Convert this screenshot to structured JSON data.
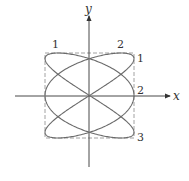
{
  "figure": {
    "type": "lissajous",
    "equations": {
      "x": "sin(3t)",
      "y": "sin(2t)"
    },
    "axes": {
      "x_label": "x",
      "y_label": "y"
    },
    "top_tangent_labels": [
      "1",
      "2"
    ],
    "right_tangent_labels": [
      "1",
      "2",
      "3"
    ],
    "colors": {
      "curve": "#6b6b6b",
      "axes": "#333333",
      "box": "#8a8a8a"
    }
  }
}
